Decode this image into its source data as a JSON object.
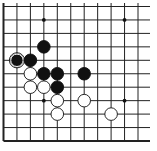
{
  "diagram": {
    "type": "go-board-fragment",
    "visible_columns": 11,
    "visible_rows": 11,
    "edges": [
      "left",
      "bottom"
    ],
    "colors": {
      "background": "#ffffff",
      "line": "#222222",
      "black": "#111111",
      "white": "#ffffff"
    },
    "star_points": [
      {
        "col": 3,
        "row": 3
      },
      {
        "col": 9,
        "row": 3
      },
      {
        "col": 3,
        "row": 9
      },
      {
        "col": 9,
        "row": 9
      }
    ],
    "stones": [
      {
        "color": "black",
        "col": 3,
        "row": 7
      },
      {
        "color": "black",
        "col": 1,
        "row": 6,
        "marked": "circle"
      },
      {
        "color": "black",
        "col": 2,
        "row": 6
      },
      {
        "color": "white",
        "col": 2,
        "row": 5
      },
      {
        "color": "black",
        "col": 3,
        "row": 5
      },
      {
        "color": "black",
        "col": 4,
        "row": 5
      },
      {
        "color": "black",
        "col": 6,
        "row": 5
      },
      {
        "color": "white",
        "col": 2,
        "row": 4
      },
      {
        "color": "white",
        "col": 3,
        "row": 4
      },
      {
        "color": "black",
        "col": 4,
        "row": 4
      },
      {
        "color": "white",
        "col": 4,
        "row": 3
      },
      {
        "color": "white",
        "col": 6,
        "row": 3
      },
      {
        "color": "white",
        "col": 4,
        "row": 2
      },
      {
        "color": "white",
        "col": 8,
        "row": 2
      }
    ]
  }
}
